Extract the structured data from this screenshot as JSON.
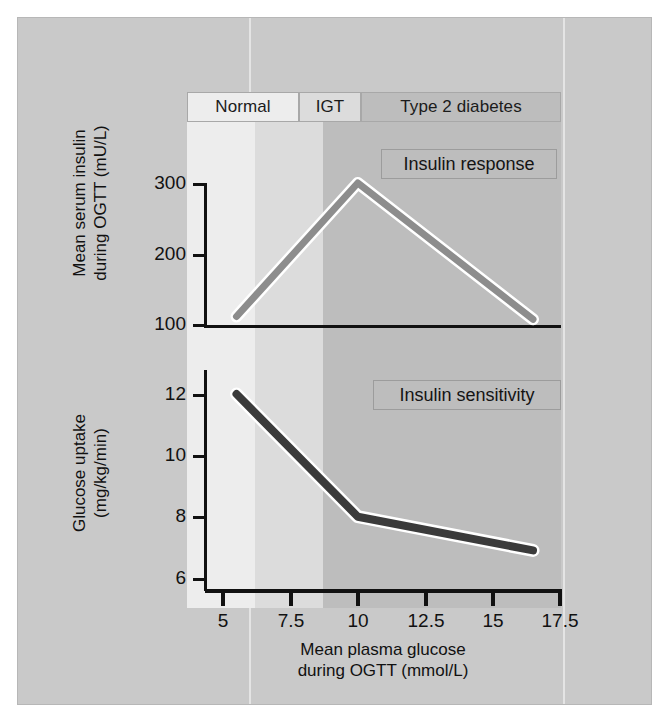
{
  "figure": {
    "background_color": "#c9c9c9",
    "panel_border_color": "#b7b7b7"
  },
  "bands": [
    {
      "key": "normal",
      "label": "Normal",
      "x_start": 5.0,
      "x_end": 7.5,
      "fill": "#ededed"
    },
    {
      "key": "igt",
      "label": "IGT",
      "x_start": 7.5,
      "x_end": 10.0,
      "fill": "#dcdcdc"
    },
    {
      "key": "t2d",
      "label": "Type 2 diabetes",
      "x_start": 10.0,
      "x_end": 17.5,
      "fill": "#bdbdbd"
    }
  ],
  "callouts": {
    "top": "Insulin response",
    "bottom": "Insulin sensitivity"
  },
  "axes": {
    "x_title_line1": "Mean plasma glucose",
    "x_title_line2": "during OGTT (mmol/L)",
    "x_ticks": [
      "5",
      "7.5",
      "10",
      "12.5",
      "15",
      "17.5"
    ],
    "top_y_title_line1": "Mean serum insulin",
    "top_y_title_line2": "during OGTT (mU/L)",
    "top_y_ticks": [
      "300",
      "200",
      "100"
    ],
    "bottom_y_title_line1": "Glucose uptake",
    "bottom_y_title_line2": "(mg/kg/min)",
    "bottom_y_ticks": [
      "12",
      "10",
      "8",
      "6"
    ]
  },
  "chart_data": [
    {
      "type": "line",
      "id": "insulin-response",
      "title": "Insulin response",
      "xlabel": "Mean plasma glucose during OGTT (mmol/L)",
      "ylabel": "Mean serum insulin during OGTT (mU/L)",
      "xlim": [
        5,
        17.5
      ],
      "ylim": [
        100,
        320
      ],
      "xticks": [
        5,
        7.5,
        10,
        12.5,
        15,
        17.5
      ],
      "yticks": [
        100,
        200,
        300
      ],
      "grid": false,
      "legend": "none",
      "line_color": "#8d8d8d",
      "x": [
        5.5,
        10.0,
        16.5
      ],
      "y": [
        112,
        300,
        108
      ],
      "annotations": [
        {
          "text": "Normal",
          "x_range": [
            5,
            7.5
          ]
        },
        {
          "text": "IGT",
          "x_range": [
            7.5,
            10
          ]
        },
        {
          "text": "Type 2 diabetes",
          "x_range": [
            10,
            17.5
          ]
        }
      ]
    },
    {
      "type": "line",
      "id": "insulin-sensitivity",
      "title": "Insulin sensitivity",
      "xlabel": "Mean plasma glucose during OGTT (mmol/L)",
      "ylabel": "Glucose uptake (mg/kg/min)",
      "xlim": [
        5,
        17.5
      ],
      "ylim": [
        5.6,
        12.8
      ],
      "xticks": [
        5,
        7.5,
        10,
        12.5,
        15,
        17.5
      ],
      "yticks": [
        6,
        8,
        10,
        12
      ],
      "grid": false,
      "legend": "none",
      "line_color": "#3b3b3b",
      "x": [
        5.5,
        10.0,
        16.5
      ],
      "y": [
        12.0,
        8.0,
        6.9
      ],
      "annotations": [
        {
          "text": "Normal",
          "x_range": [
            5,
            7.5
          ]
        },
        {
          "text": "IGT",
          "x_range": [
            7.5,
            10
          ]
        },
        {
          "text": "Type 2 diabetes",
          "x_range": [
            10,
            17.5
          ]
        }
      ]
    }
  ]
}
